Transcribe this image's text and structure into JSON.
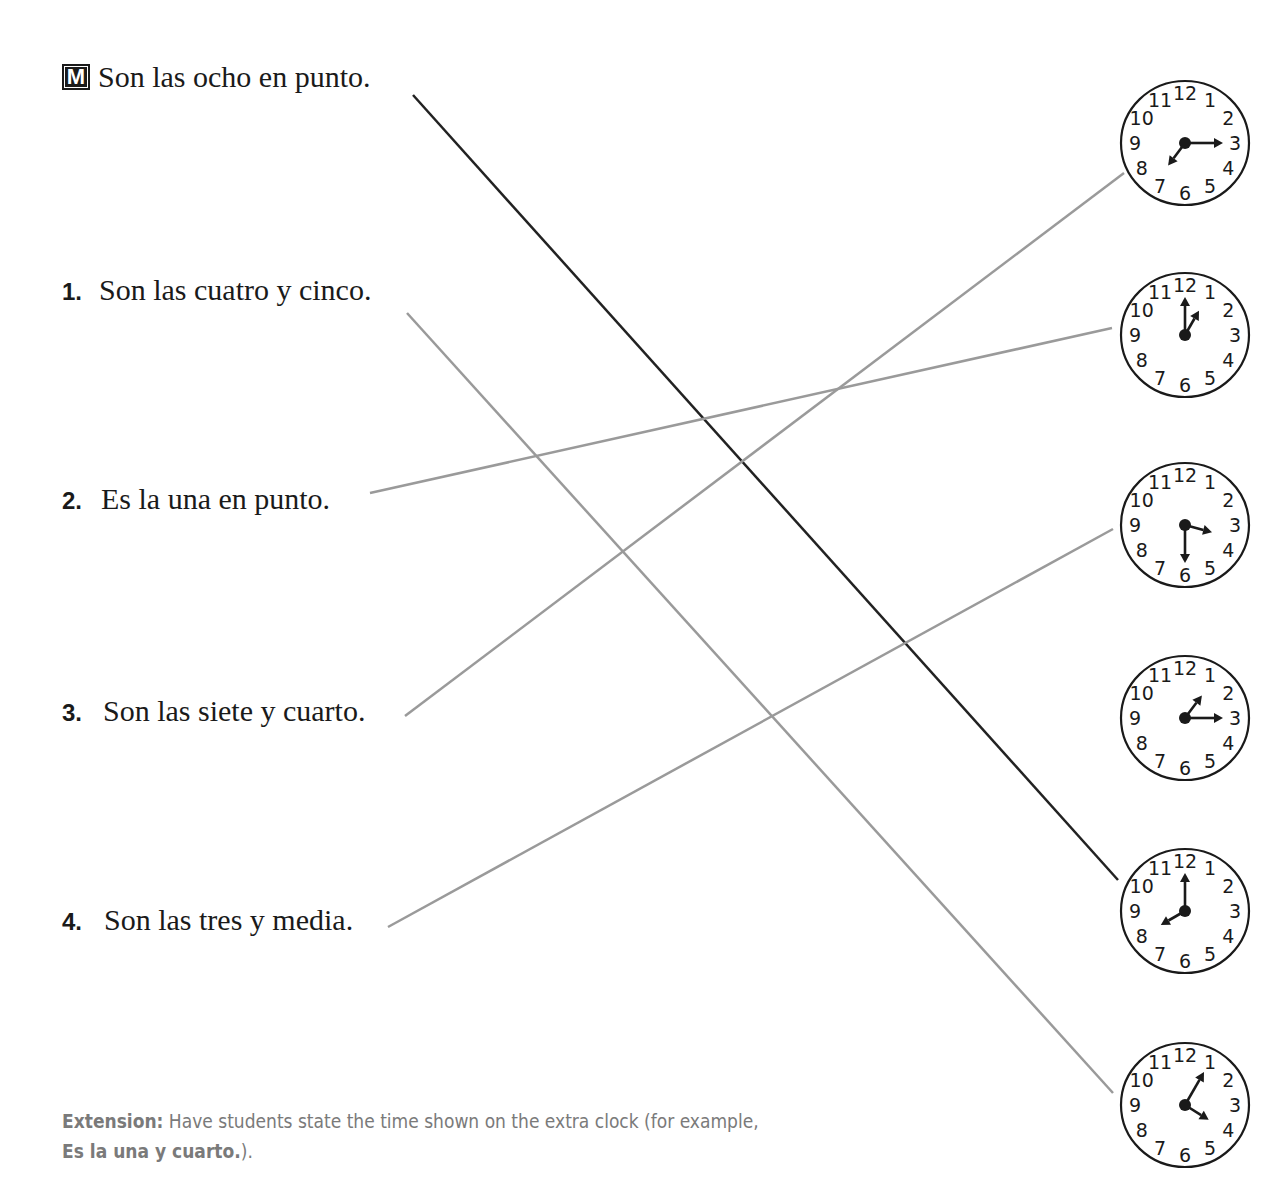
{
  "model": {
    "badge": "M",
    "text": "Son las ocho en punto."
  },
  "items": [
    {
      "number": "1.",
      "text": "Son las cuatro y cinco."
    },
    {
      "number": "2.",
      "text": "Es la una en punto."
    },
    {
      "number": "3.",
      "text": "Son las siete y cuarto."
    },
    {
      "number": "4.",
      "text": "Son las tres y media."
    }
  ],
  "clocks": [
    {
      "label": "7:15",
      "hour_hand_deg": 217,
      "minute_hand_deg": 90
    },
    {
      "label": "1:00",
      "hour_hand_deg": 30,
      "minute_hand_deg": 0
    },
    {
      "label": "3:30",
      "hour_hand_deg": 105,
      "minute_hand_deg": 180
    },
    {
      "label": "1:15",
      "hour_hand_deg": 37,
      "minute_hand_deg": 90
    },
    {
      "label": "8:00",
      "hour_hand_deg": 240,
      "minute_hand_deg": 0
    },
    {
      "label": "4:05",
      "hour_hand_deg": 122,
      "minute_hand_deg": 30
    }
  ],
  "clock_numerals": [
    "12",
    "1",
    "2",
    "3",
    "4",
    "5",
    "6",
    "7",
    "8",
    "9",
    "10",
    "11"
  ],
  "connections": [
    {
      "from": "model",
      "to_clock": 5,
      "color": "#222222"
    },
    {
      "from": "item-1",
      "to_clock": 6,
      "color": "#9a9a9a"
    },
    {
      "from": "item-2",
      "to_clock": 2,
      "color": "#9a9a9a"
    },
    {
      "from": "item-3",
      "to_clock": 1,
      "color": "#9a9a9a"
    },
    {
      "from": "item-4",
      "to_clock": 3,
      "color": "#9a9a9a"
    }
  ],
  "extension": {
    "label": "Extension:",
    "text": " Have students state the time shown on the extra clock (for example, ",
    "example": "Es la una y cuarto.",
    "closing": ")."
  }
}
